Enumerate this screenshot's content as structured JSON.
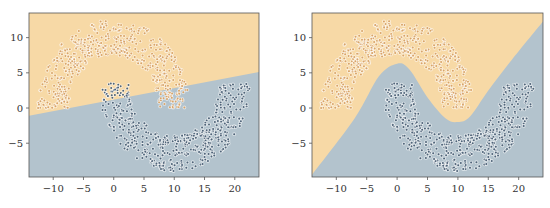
{
  "chart_data": [
    {
      "type": "scatter",
      "title": "",
      "xlabel": "",
      "ylabel": "",
      "xlim": [
        -14,
        24
      ],
      "ylim": [
        -9.8,
        13.5
      ],
      "xticks": [
        -10,
        -5,
        0,
        5,
        10,
        15,
        20
      ],
      "xtick_labels": [
        "−10",
        "−5",
        "0",
        "5",
        "10",
        "15",
        "20"
      ],
      "yticks": [
        -5,
        0,
        5,
        10
      ],
      "ytick_labels": [
        "−5",
        "0",
        "5",
        "10"
      ],
      "grid": false,
      "legend": "none",
      "background_regions": {
        "class_a_color": "#f7d9a6",
        "class_b_color": "#b3c3cd",
        "boundary": "linear",
        "boundary_points": [
          [
            -14,
            -1.1
          ],
          [
            24,
            5.1
          ]
        ]
      },
      "series": [
        {
          "name": "upper moon",
          "color": "#d9a468",
          "shape": "half-ring",
          "center": [
            0,
            0
          ],
          "radius": 10,
          "width": 5,
          "angle_range_deg": [
            0,
            180
          ],
          "n_points": 500
        },
        {
          "name": "lower moon",
          "color": "#4f6479",
          "shape": "half-ring",
          "center": [
            10,
            3.5
          ],
          "radius": 10,
          "width": 5,
          "angle_range_deg": [
            180,
            360
          ],
          "n_points": 500
        }
      ]
    },
    {
      "type": "scatter",
      "title": "",
      "xlabel": "",
      "ylabel": "",
      "xlim": [
        -14,
        24
      ],
      "ylim": [
        -9.8,
        13.5
      ],
      "xticks": [
        -10,
        -5,
        0,
        5,
        10,
        15,
        20
      ],
      "xtick_labels": [
        "−10",
        "−5",
        "0",
        "5",
        "10",
        "15",
        "20"
      ],
      "yticks": [
        -5,
        0,
        5,
        10
      ],
      "ytick_labels": [
        "−5",
        "0",
        "5",
        "10"
      ],
      "grid": false,
      "legend": "none",
      "background_regions": {
        "class_a_color": "#f7d9a6",
        "class_b_color": "#b3c3cd",
        "boundary": "nonlinear",
        "boundary_points": [
          [
            -14,
            -9.5
          ],
          [
            -7,
            -1.5
          ],
          [
            -3,
            4.5
          ],
          [
            0,
            6.3
          ],
          [
            2,
            5.5
          ],
          [
            5,
            1.5
          ],
          [
            8,
            -1.5
          ],
          [
            10,
            -2.0
          ],
          [
            12,
            -1.2
          ],
          [
            15,
            2.5
          ],
          [
            19,
            7.0
          ],
          [
            24,
            12.3
          ]
        ]
      },
      "series": [
        {
          "name": "upper moon",
          "color": "#d9a468",
          "shape": "half-ring",
          "center": [
            0,
            0
          ],
          "radius": 10,
          "width": 5,
          "angle_range_deg": [
            0,
            180
          ],
          "n_points": 500
        },
        {
          "name": "lower moon",
          "color": "#4f6479",
          "shape": "half-ring",
          "center": [
            10,
            3.5
          ],
          "radius": 10,
          "width": 5,
          "angle_range_deg": [
            180,
            360
          ],
          "n_points": 500
        }
      ]
    }
  ]
}
